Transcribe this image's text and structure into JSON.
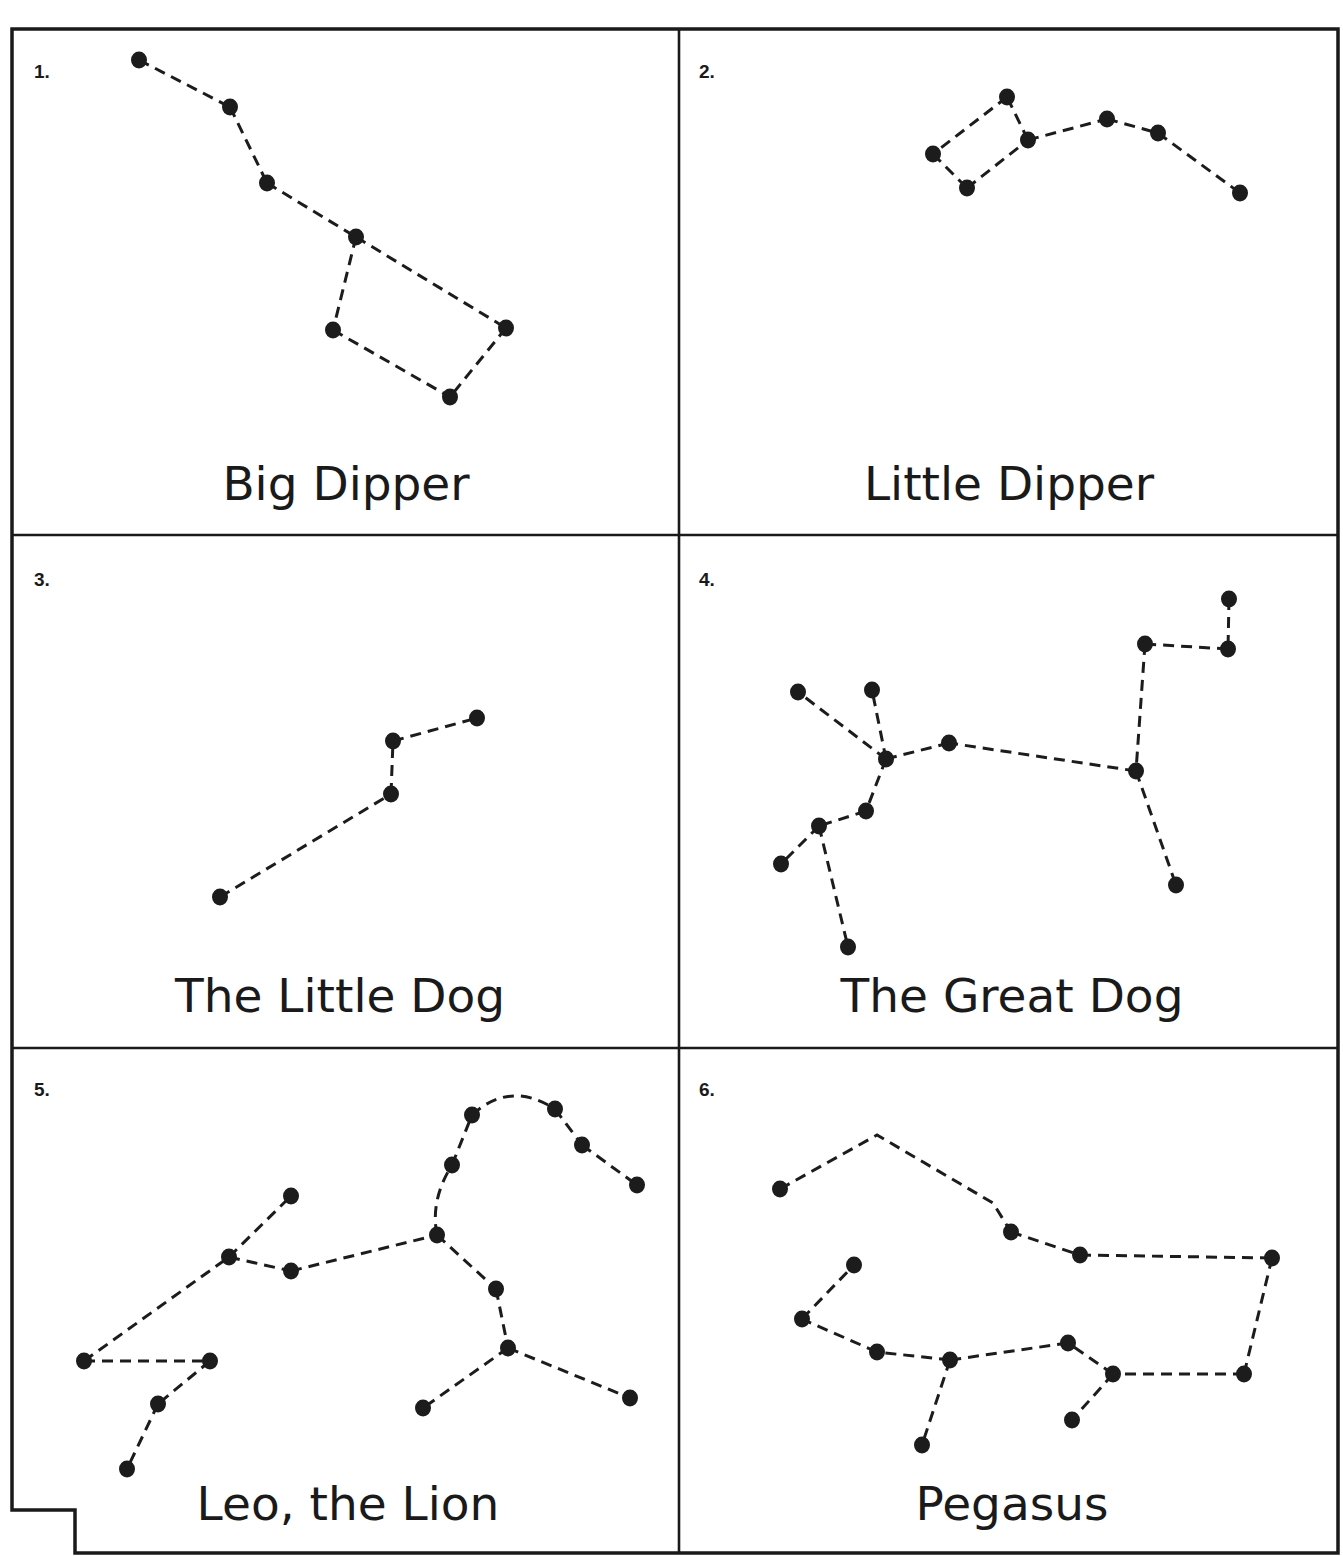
{
  "sheet": {
    "width": 1343,
    "height": 1556,
    "ink_color": "#1c1c1c",
    "paper_color": "#ffffff",
    "frame_path": "M 12 1510 L 12 29 L 1338 29 L 1338 1553 L 75 1553 L 75 1510 Z",
    "grid": {
      "vertical_x": 679,
      "horizontal_y": [
        535,
        1048
      ],
      "top": 29,
      "bottom": 1553,
      "left": 12,
      "right": 1338
    }
  },
  "panels": [
    {
      "number": "1.",
      "name": "Big Dipper",
      "number_pos": [
        34,
        78
      ],
      "name_pos": [
        346,
        500
      ],
      "stars": [
        [
          139,
          60
        ],
        [
          230,
          107
        ],
        [
          267,
          183
        ],
        [
          356,
          237
        ],
        [
          333,
          330
        ],
        [
          506,
          328
        ],
        [
          450,
          397
        ]
      ],
      "links": [
        [
          0,
          1
        ],
        [
          1,
          2
        ],
        [
          2,
          3
        ],
        [
          3,
          4
        ],
        [
          3,
          5
        ],
        [
          4,
          6
        ],
        [
          5,
          6
        ]
      ]
    },
    {
      "number": "2.",
      "name": "Little Dipper",
      "number_pos": [
        699,
        78
      ],
      "name_pos": [
        1009,
        500
      ],
      "stars": [
        [
          1007,
          97
        ],
        [
          933,
          154
        ],
        [
          967,
          188
        ],
        [
          1028,
          140
        ],
        [
          1107,
          119
        ],
        [
          1158,
          133
        ],
        [
          1240,
          193
        ]
      ],
      "links": [
        [
          0,
          1
        ],
        [
          1,
          2
        ],
        [
          2,
          3
        ],
        [
          3,
          0
        ],
        [
          3,
          4
        ],
        [
          4,
          5
        ],
        [
          5,
          6
        ]
      ]
    },
    {
      "number": "3.",
      "name": "The Little Dog",
      "number_pos": [
        34,
        586
      ],
      "name_pos": [
        340,
        1012
      ],
      "stars": [
        [
          220,
          897
        ],
        [
          391,
          794
        ],
        [
          393,
          741
        ],
        [
          477,
          718
        ]
      ],
      "links": [
        [
          0,
          1
        ],
        [
          1,
          2
        ],
        [
          2,
          3
        ]
      ]
    },
    {
      "number": "4.",
      "name": "The Great Dog",
      "number_pos": [
        699,
        586
      ],
      "name_pos": [
        1012,
        1012
      ],
      "stars": [
        [
          1229,
          599
        ],
        [
          1228,
          649
        ],
        [
          1145,
          644
        ],
        [
          1136,
          771
        ],
        [
          1176,
          885
        ],
        [
          949,
          743
        ],
        [
          886,
          759
        ],
        [
          798,
          692
        ],
        [
          872,
          690
        ],
        [
          866,
          811
        ],
        [
          819,
          826
        ],
        [
          781,
          864
        ],
        [
          848,
          947
        ]
      ],
      "links": [
        [
          0,
          1
        ],
        [
          1,
          2
        ],
        [
          2,
          3
        ],
        [
          3,
          4
        ],
        [
          3,
          5
        ],
        [
          5,
          6
        ],
        [
          6,
          7
        ],
        [
          6,
          8
        ],
        [
          6,
          9
        ],
        [
          9,
          10
        ],
        [
          10,
          11
        ],
        [
          10,
          12
        ]
      ]
    },
    {
      "number": "5.",
      "name": "Leo, the Lion",
      "number_pos": [
        34,
        1096
      ],
      "name_pos": [
        348,
        1520
      ],
      "stars": [
        [
          84,
          1361
        ],
        [
          210,
          1361
        ],
        [
          158,
          1404
        ],
        [
          127,
          1469
        ],
        [
          229,
          1257
        ],
        [
          291,
          1196
        ],
        [
          291,
          1271
        ],
        [
          437,
          1235
        ],
        [
          452,
          1165
        ],
        [
          472,
          1115
        ],
        [
          555,
          1109
        ],
        [
          582,
          1145
        ],
        [
          637,
          1185
        ],
        [
          496,
          1289
        ],
        [
          508,
          1348
        ],
        [
          423,
          1408
        ],
        [
          630,
          1398
        ]
      ],
      "links": [
        [
          0,
          1
        ],
        [
          1,
          2
        ],
        [
          2,
          3
        ],
        [
          0,
          4
        ],
        [
          4,
          5
        ],
        [
          4,
          6
        ],
        [
          6,
          7
        ],
        [
          8,
          9
        ],
        [
          10,
          11
        ],
        [
          11,
          12
        ],
        [
          7,
          13
        ],
        [
          13,
          14
        ],
        [
          14,
          15
        ],
        [
          14,
          16
        ]
      ],
      "curves": [
        "M 437 1235 Q 430 1200 452 1165",
        "M 472 1115 Q 510 1080 555 1109"
      ]
    },
    {
      "number": "6.",
      "name": "Pegasus",
      "number_pos": [
        699,
        1096
      ],
      "name_pos": [
        1012,
        1520
      ],
      "stars": [
        [
          780,
          1189
        ],
        [
          1011,
          1232
        ],
        [
          1080,
          1255
        ],
        [
          1272,
          1258
        ],
        [
          1244,
          1374
        ],
        [
          1113,
          1374
        ],
        [
          1068,
          1343
        ],
        [
          950,
          1360
        ],
        [
          877,
          1352
        ],
        [
          802,
          1319
        ],
        [
          854,
          1265
        ],
        [
          922,
          1445
        ],
        [
          1072,
          1420
        ]
      ],
      "links": [
        [
          1,
          2
        ],
        [
          2,
          3
        ],
        [
          3,
          4
        ],
        [
          4,
          5
        ],
        [
          5,
          6
        ],
        [
          6,
          7
        ],
        [
          7,
          8
        ],
        [
          8,
          9
        ],
        [
          9,
          10
        ],
        [
          7,
          11
        ],
        [
          5,
          12
        ]
      ],
      "polylines": [
        "780,1189 877,1135 993,1203 1011,1232"
      ]
    }
  ]
}
